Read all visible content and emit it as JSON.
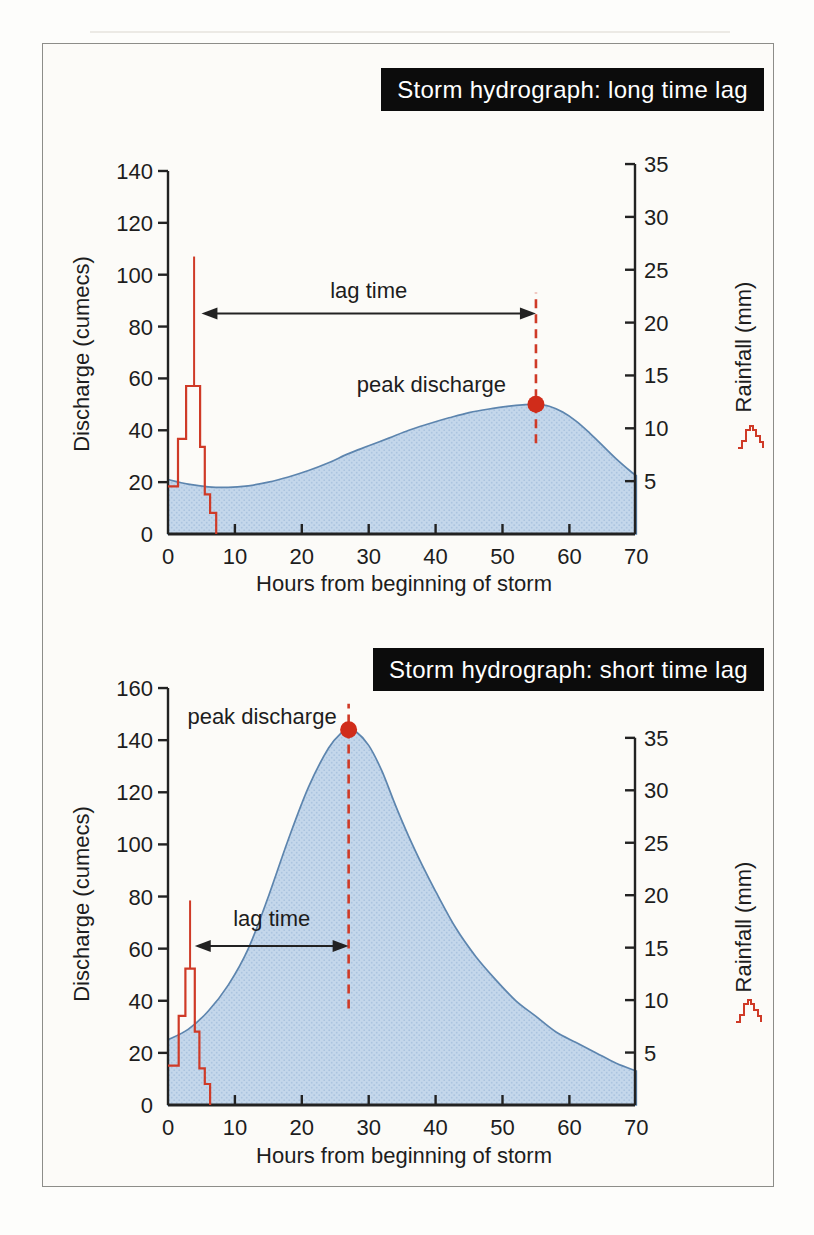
{
  "colors": {
    "rain_red": "#cf3a27",
    "peak_dot_red": "#d02c1a",
    "curve_stroke": "#5d85ae",
    "area_fill": "#c4d7eb",
    "area_dot": "#abc4df",
    "ink": "#222222",
    "title_bg": "#0c0c0c",
    "title_fg": "#ffffff"
  },
  "chart_data": [
    {
      "type": "area",
      "title": "Storm hydrograph: long time lag",
      "xlabel": "Hours from beginning of storm",
      "ylabel": "Discharge (cumecs)",
      "y2label": "Rainfall (mm)",
      "x_ticks": [
        0,
        10,
        20,
        30,
        40,
        50,
        60,
        70
      ],
      "y_ticks": [
        0,
        20,
        40,
        60,
        80,
        100,
        120,
        140
      ],
      "y2_ticks": [
        5,
        10,
        15,
        20,
        25,
        30,
        35
      ],
      "xlim": [
        0,
        70
      ],
      "ylim_left": [
        0,
        140
      ],
      "ylim_right": [
        0,
        35
      ],
      "hydrograph": [
        [
          0,
          21
        ],
        [
          3,
          19.2
        ],
        [
          6,
          18.2
        ],
        [
          9,
          18
        ],
        [
          12,
          18.6
        ],
        [
          15,
          20
        ],
        [
          18,
          22
        ],
        [
          21,
          24.5
        ],
        [
          24,
          27.5
        ],
        [
          27,
          31
        ],
        [
          30,
          34
        ],
        [
          33,
          37
        ],
        [
          36,
          40
        ],
        [
          39,
          42.5
        ],
        [
          42,
          44.8
        ],
        [
          45,
          46.8
        ],
        [
          48,
          48.2
        ],
        [
          51,
          49.3
        ],
        [
          53,
          49.8
        ],
        [
          55,
          50
        ],
        [
          57,
          49.3
        ],
        [
          59,
          47
        ],
        [
          61,
          43.5
        ],
        [
          63,
          39
        ],
        [
          65,
          34
        ],
        [
          67,
          29
        ],
        [
          69,
          24.5
        ],
        [
          70,
          22.5
        ]
      ],
      "rain_levels": [
        [
          0,
          4.5
        ],
        [
          1.5,
          9
        ],
        [
          2.7,
          14
        ],
        [
          4.8,
          8.25
        ],
        [
          5.5,
          3.75
        ],
        [
          6.3,
          2
        ],
        [
          7.2,
          0
        ]
      ],
      "rain_spike": {
        "x": 3.9,
        "base": 14,
        "top": 26.25
      },
      "peak": {
        "x": 55,
        "y": 50,
        "label": "peak discharge"
      },
      "peak_dash": {
        "x": 55,
        "y_from": 35,
        "y_to": 93
      },
      "lag": {
        "x1": 5,
        "x2": 55,
        "y": 85,
        "label": "lag time"
      }
    },
    {
      "type": "area",
      "title": "Storm hydrograph: short time lag",
      "xlabel": "Hours from beginning of storm",
      "ylabel": "Discharge (cumecs)",
      "y2label": "Rainfall (mm)",
      "x_ticks": [
        0,
        10,
        20,
        30,
        40,
        50,
        60,
        70
      ],
      "y_ticks": [
        0,
        20,
        40,
        60,
        80,
        100,
        120,
        140,
        160
      ],
      "y2_ticks": [
        5,
        10,
        15,
        20,
        25,
        30,
        35
      ],
      "xlim": [
        0,
        70
      ],
      "ylim_left": [
        0,
        160
      ],
      "ylim_right": [
        0,
        35
      ],
      "hydrograph": [
        [
          0,
          25
        ],
        [
          3,
          29
        ],
        [
          6,
          36
        ],
        [
          9,
          46
        ],
        [
          12,
          60
        ],
        [
          15,
          80
        ],
        [
          18,
          102
        ],
        [
          21,
          122
        ],
        [
          24,
          137
        ],
        [
          26,
          143
        ],
        [
          27,
          144
        ],
        [
          28,
          143.5
        ],
        [
          30,
          138
        ],
        [
          32,
          128
        ],
        [
          34,
          115
        ],
        [
          36,
          103
        ],
        [
          38,
          92
        ],
        [
          40,
          82
        ],
        [
          43,
          68
        ],
        [
          46,
          57
        ],
        [
          49,
          48
        ],
        [
          52,
          40
        ],
        [
          55,
          34
        ],
        [
          58,
          28
        ],
        [
          61,
          24
        ],
        [
          64,
          20
        ],
        [
          67,
          16
        ],
        [
          70,
          13
        ]
      ],
      "rain_levels": [
        [
          0,
          3.75
        ],
        [
          1.6,
          8.5
        ],
        [
          2.6,
          13
        ],
        [
          4.0,
          7
        ],
        [
          4.7,
          3.5
        ],
        [
          5.5,
          2
        ],
        [
          6.3,
          0
        ]
      ],
      "rain_spike": {
        "x": 3.3,
        "base": 13,
        "top": 19.5
      },
      "peak": {
        "x": 27,
        "y": 144,
        "label": "peak discharge"
      },
      "peak_dash": {
        "x": 27,
        "y_from": 37,
        "y_to": 154
      },
      "lag": {
        "x1": 4,
        "x2": 27,
        "y": 61,
        "label": "lag time"
      }
    }
  ]
}
